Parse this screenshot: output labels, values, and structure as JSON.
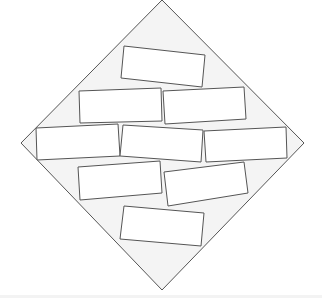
{
  "diagram": {
    "width": 322,
    "height": 298,
    "background": "#ffffff",
    "diamond": {
      "points": [
        [
          162,
          0
        ],
        [
          304,
          143
        ],
        [
          162,
          290
        ],
        [
          21,
          143
        ]
      ],
      "fill": "#f4f4f4",
      "stroke": "#555555",
      "stroke_width": 1
    },
    "rect_style": {
      "fill": "#ffffff",
      "stroke": "#555555",
      "stroke_width": 1
    },
    "rectangles": [
      {
        "id": "rect-top",
        "points": [
          [
            124,
            46
          ],
          [
            205,
            55
          ],
          [
            202,
            87
          ],
          [
            121,
            78
          ]
        ]
      },
      {
        "id": "rect-row2-left",
        "points": [
          [
            79,
            91
          ],
          [
            161,
            88
          ],
          [
            162,
            121
          ],
          [
            80,
            123
          ]
        ]
      },
      {
        "id": "rect-row2-right",
        "points": [
          [
            163,
            91
          ],
          [
            244,
            87
          ],
          [
            246,
            119
          ],
          [
            165,
            124
          ]
        ]
      },
      {
        "id": "rect-row3-left",
        "points": [
          [
            36,
            128
          ],
          [
            118,
            124
          ],
          [
            120,
            156
          ],
          [
            37,
            160
          ]
        ]
      },
      {
        "id": "rect-row3-middle",
        "points": [
          [
            123,
            125
          ],
          [
            203,
            130
          ],
          [
            201,
            162
          ],
          [
            120,
            156
          ]
        ]
      },
      {
        "id": "rect-row3-right",
        "points": [
          [
            204,
            131
          ],
          [
            286,
            127
          ],
          [
            287,
            158
          ],
          [
            206,
            162
          ]
        ]
      },
      {
        "id": "rect-row4-left",
        "points": [
          [
            78,
            167
          ],
          [
            160,
            161
          ],
          [
            162,
            193
          ],
          [
            80,
            200
          ]
        ]
      },
      {
        "id": "rect-row4-right",
        "points": [
          [
            164,
            172
          ],
          [
            244,
            162
          ],
          [
            248,
            193
          ],
          [
            168,
            206
          ]
        ]
      },
      {
        "id": "rect-bottom",
        "points": [
          [
            124,
            206
          ],
          [
            204,
            213
          ],
          [
            201,
            246
          ],
          [
            120,
            239
          ]
        ]
      }
    ]
  }
}
